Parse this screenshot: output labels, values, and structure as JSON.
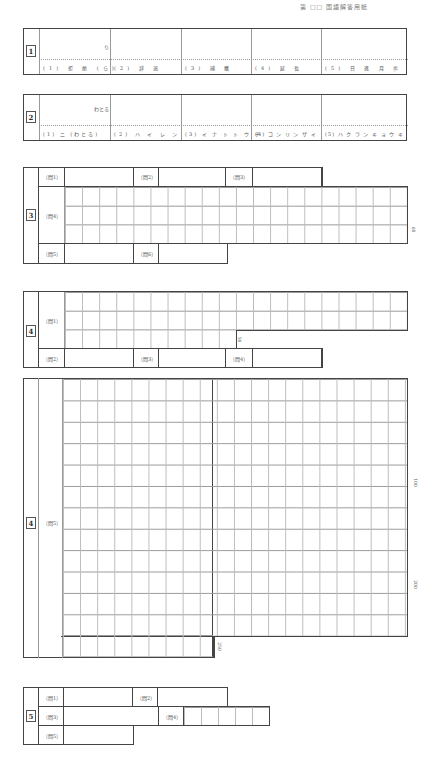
{
  "header": {
    "text": "第 □□ 国語解答用紙"
  },
  "section1": {
    "number": "1",
    "hint": "り",
    "items": [
      {
        "label": "(1) 拒 絶 (ら)"
      },
      {
        "label": "(2) 辞 退"
      },
      {
        "label": "(3) 捕 獲"
      },
      {
        "label": "(4) 延 長"
      },
      {
        "label": "(5) 日 進 月 歩"
      }
    ]
  },
  "section2": {
    "number": "2",
    "hint": "わとる",
    "items": [
      {
        "label": "(1) ニ (わとる)"
      },
      {
        "label": "(2) ハ イ レ ン"
      },
      {
        "label": "(3) イ ナ ト ト ウ チ"
      },
      {
        "label": "(4) コ ン リ ン ザ イ"
      },
      {
        "label": "(5) ハ ク ラ ン キ ョ ウ キ"
      }
    ]
  },
  "section3": {
    "number": "3",
    "q1": "〔問1〕",
    "q2": "〔問2〕",
    "q3": "〔問3〕",
    "q4": "〔問4〕",
    "q5": "〔問5〕",
    "q6": "〔問6〕",
    "q4_count": "60"
  },
  "section4a": {
    "number": "4",
    "q1": "〔問1〕",
    "q2": "〔問2〕",
    "q3": "〔問3〕",
    "q4": "〔問4〕",
    "q1_count": "50"
  },
  "section4b": {
    "number": "4",
    "q5": "〔問5〕",
    "count_100": "100",
    "count_200": "200",
    "count_250": "250"
  },
  "section5": {
    "number": "5",
    "q1": "〔問1〕",
    "q2": "〔問2〕",
    "q3": "〔問3〕",
    "q4": "〔問4〕",
    "q5": "〔問5〕"
  }
}
